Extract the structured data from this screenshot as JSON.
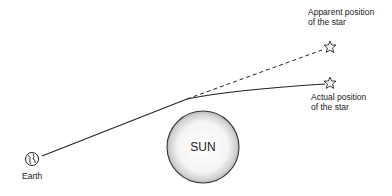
{
  "diagram": {
    "title": "",
    "labels": {
      "apparent_star": [
        "Apparent position",
        "of the star"
      ],
      "actual_star": [
        "Actual position",
        "of the star"
      ],
      "sun": "SUN",
      "earth": "Earth"
    },
    "elements": [
      {
        "name": "earth",
        "icon": "globe-icon"
      },
      {
        "name": "sun",
        "shape": "circle"
      },
      {
        "name": "apparent-star",
        "icon": "star-outline-icon"
      },
      {
        "name": "actual-star",
        "icon": "star-outline-icon"
      },
      {
        "name": "light-path",
        "style": "solid",
        "from": "actual-star",
        "to": "earth",
        "note": "bent near sun"
      },
      {
        "name": "apparent-line",
        "style": "dashed",
        "from": "bend-point",
        "to": "apparent-star"
      }
    ],
    "colors": {
      "line": "#222222",
      "sun_fill_center": "#ffffff",
      "sun_fill_edge": "#bdbdbd",
      "sun_stroke": "#333333",
      "background": "#ffffff"
    }
  }
}
